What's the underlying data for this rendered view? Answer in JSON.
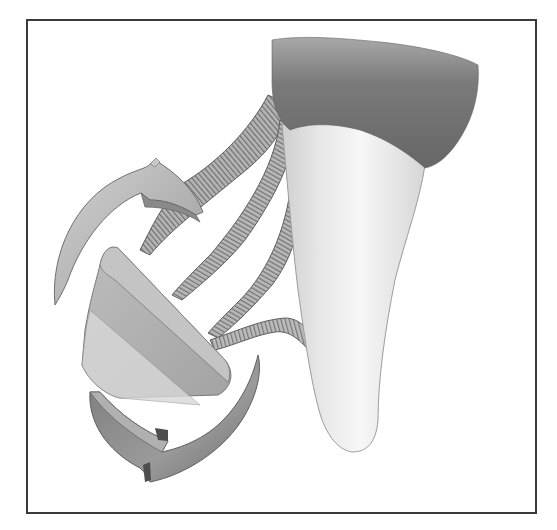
{
  "figure": {
    "colors": {
      "frame": "#3a3a3a",
      "gum_dark": "#6e6e6e",
      "gum_light": "#9a9a9a",
      "tooth_light": "#f2f2f2",
      "tooth_shadow": "#c8c8c8",
      "fiber": "#8a8a8a",
      "fiber_stroke": "#5a5a5a",
      "arrow_light": "#c9c9c9",
      "arrow_dark": "#7d7d7d",
      "block_face": "#b8b8b8",
      "block_side": "#9c9c9c"
    },
    "elements": [
      "gum-tissue",
      "tooth-root",
      "ligament-fibers",
      "rotation-arrow-top",
      "rotation-arrow-bottom",
      "rotating-block"
    ]
  }
}
